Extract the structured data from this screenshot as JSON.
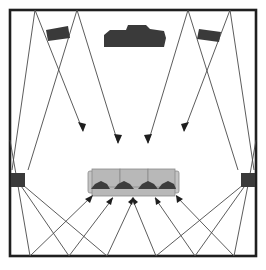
{
  "diagram": {
    "room": {
      "x": 10,
      "y": 10,
      "width": 246,
      "height": 246,
      "stroke": "#1f1f1f"
    },
    "colors": {
      "ray": "#4a4a4a",
      "speaker": "#3a3a3a",
      "couch": "#b8b8b8",
      "listener": "#3d3d3d",
      "arrow": "#1e1e1e"
    },
    "components": {
      "center_speaker": "center speaker / soundbar",
      "front_left_speaker": "front-left speaker",
      "front_right_speaker": "front-right speaker",
      "left_surround_speaker": "left surround speaker",
      "right_surround_speaker": "right surround speaker",
      "couch": "couch with 4 listeners"
    },
    "listener_count": 4,
    "front_reflections": [
      {
        "from": [
          58,
          34
        ],
        "wall": [
          35,
          10
        ],
        "to": [
          83,
          131
        ]
      },
      {
        "from": [
          58,
          34
        ],
        "wall": [
          77,
          10
        ],
        "to": [
          118,
          143
        ]
      },
      {
        "from": [
          208,
          34
        ],
        "wall": [
          188,
          10
        ],
        "to": [
          148,
          143
        ]
      },
      {
        "from": [
          208,
          34
        ],
        "wall": [
          230,
          10
        ],
        "to": [
          184,
          131
        ]
      }
    ],
    "rear_reflections": [
      {
        "from": [
          17,
          180
        ],
        "floor": [
          30,
          256
        ],
        "to": [
          92,
          196
        ]
      },
      {
        "from": [
          17,
          180
        ],
        "floor": [
          69,
          256
        ],
        "to": [
          113,
          198
        ]
      },
      {
        "from": [
          17,
          180
        ],
        "floor": [
          107,
          256
        ],
        "to": [
          134,
          198
        ]
      },
      {
        "from": [
          249,
          180
        ],
        "floor": [
          156,
          256
        ],
        "to": [
          132,
          198
        ]
      },
      {
        "from": [
          249,
          180
        ],
        "floor": [
          195,
          256
        ],
        "to": [
          155,
          198
        ]
      },
      {
        "from": [
          249,
          180
        ],
        "floor": [
          234,
          256
        ],
        "to": [
          176,
          196
        ]
      }
    ]
  }
}
